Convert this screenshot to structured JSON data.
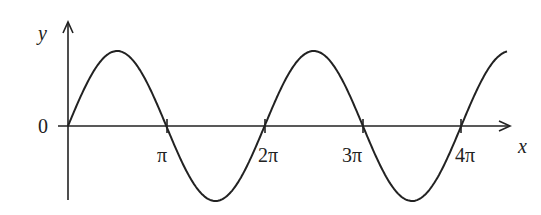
{
  "chart_data": {
    "type": "line",
    "title": "",
    "function": "y = sin(x)",
    "xlabel": "x",
    "ylabel": "y",
    "origin_label": "0",
    "x_ticks": [
      {
        "value": 3.14159,
        "label": "π"
      },
      {
        "value": 6.28319,
        "label": "2π"
      },
      {
        "value": 9.42478,
        "label": "3π"
      },
      {
        "value": 12.56637,
        "label": "4π"
      }
    ],
    "xlim": [
      0,
      14.0
    ],
    "ylim": [
      -1,
      1
    ],
    "grid": false,
    "series": [
      {
        "name": "sin x",
        "color": "#222222"
      }
    ]
  },
  "labels": {
    "y": "y",
    "x": "x",
    "zero": "0",
    "t1": "π",
    "t2": "2π",
    "t3": "3π",
    "t4": "4π"
  }
}
